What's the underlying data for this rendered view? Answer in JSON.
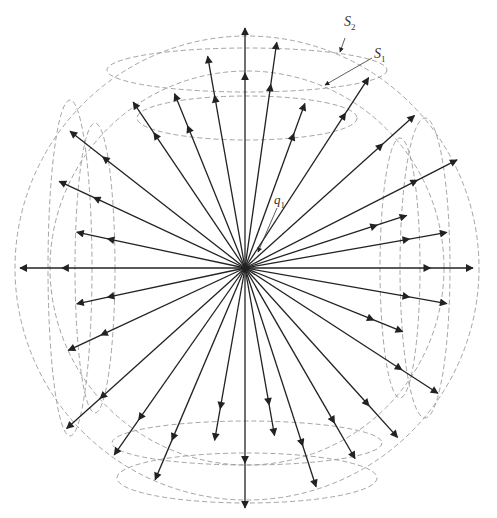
{
  "diagram": {
    "title": "",
    "center": [
      245,
      268
    ],
    "labels": {
      "s2": {
        "base": "S",
        "sub": "2"
      },
      "s1": {
        "base": "S",
        "sub": "1"
      },
      "q1": {
        "base": "q",
        "sub": "1"
      }
    },
    "colors": {
      "arrow": "#222222",
      "dashed": "#9a9a9a"
    },
    "outer_sphere_radius": 232,
    "inner_sphere_radius": 195,
    "arrows": [
      {
        "angle": 90,
        "len": 240
      },
      {
        "angle": 82,
        "len": 228
      },
      {
        "angle": 70,
        "len": 175
      },
      {
        "angle": 57,
        "len": 227
      },
      {
        "angle": 42,
        "len": 228
      },
      {
        "angle": 27,
        "len": 238
      },
      {
        "angle": 18,
        "len": 170
      },
      {
        "angle": 10,
        "len": 205
      },
      {
        "angle": 0,
        "len": 228
      },
      {
        "angle": -10,
        "len": 205
      },
      {
        "angle": -22,
        "len": 170
      },
      {
        "angle": -33,
        "len": 230
      },
      {
        "angle": -48,
        "len": 228
      },
      {
        "angle": -60,
        "len": 220
      },
      {
        "angle": -72,
        "len": 230
      },
      {
        "angle": -80,
        "len": 170
      },
      {
        "angle": -90,
        "len": 240
      },
      {
        "angle": -100,
        "len": 175
      },
      {
        "angle": -113,
        "len": 230
      },
      {
        "angle": -125,
        "len": 228
      },
      {
        "angle": -138,
        "len": 240
      },
      {
        "angle": -155,
        "len": 195
      },
      {
        "angle": -168,
        "len": 172
      },
      {
        "angle": 180,
        "len": 225
      },
      {
        "angle": 168,
        "len": 172
      },
      {
        "angle": 155,
        "len": 205
      },
      {
        "angle": 142,
        "len": 222
      },
      {
        "angle": 124,
        "len": 200
      },
      {
        "angle": 112,
        "len": 188
      },
      {
        "angle": 100,
        "len": 215
      }
    ]
  }
}
